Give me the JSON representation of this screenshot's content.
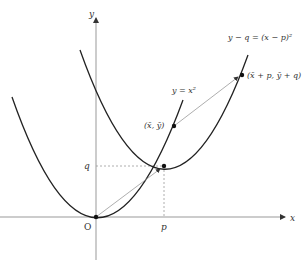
{
  "header": {
    "cut_text": "— — — — — — — — —"
  },
  "axes": {
    "x_label": "x",
    "y_label": "y",
    "origin_label": "O",
    "p_label": "p",
    "q_label": "q"
  },
  "curves": {
    "base": {
      "label": "y = x²"
    },
    "shifted": {
      "label": "y − q = (x − p)²"
    }
  },
  "points": {
    "p1": {
      "label": "(x̄, ȳ)"
    },
    "p2": {
      "label": "(x̄ + p,  ȳ + q)"
    }
  },
  "colors": {
    "curve": "#222222",
    "axis": "#999999",
    "arrow": "#999999",
    "dash": "#999999"
  }
}
